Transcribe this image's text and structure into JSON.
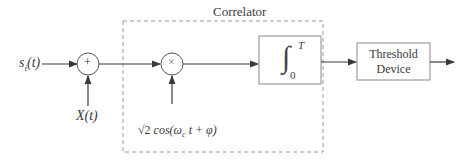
{
  "diagram": {
    "type": "block-diagram",
    "input_signal": {
      "label": "s",
      "subscript": "i",
      "arg": "(t)"
    },
    "noise": {
      "label": "X(t)"
    },
    "adder": {
      "symbol": "+"
    },
    "multiplier": {
      "symbol": "×"
    },
    "correlator": {
      "title": "Correlator"
    },
    "reference": {
      "sqrt": "√2",
      "text": " cos(ω",
      "subscript": "c",
      "rest": " t + φ)"
    },
    "integrator": {
      "symbol": "∫",
      "lower": "0",
      "upper": "T"
    },
    "threshold": {
      "line1": "Threshold",
      "line2": "Device"
    },
    "colors": {
      "line": "#3a3a3a",
      "dashed": "#9a9a9a",
      "box": "#8a8a8a"
    }
  }
}
